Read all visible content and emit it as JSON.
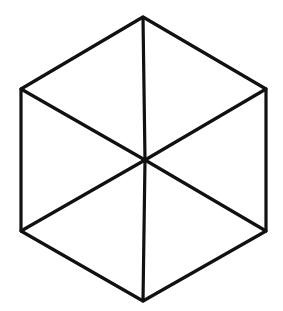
{
  "diagram": {
    "title": "",
    "shape": "hexagon-with-center-spokes",
    "stroke_color": "#111111",
    "background": "#ffffff",
    "stroke_width": 3.2,
    "vertices": [
      {
        "name": "top",
        "x": 143,
        "y": 17
      },
      {
        "name": "upper-right",
        "x": 266,
        "y": 89
      },
      {
        "name": "lower-right",
        "x": 266,
        "y": 231
      },
      {
        "name": "bottom",
        "x": 143,
        "y": 301
      },
      {
        "name": "lower-left",
        "x": 21,
        "y": 231
      },
      {
        "name": "upper-left",
        "x": 21,
        "y": 89
      }
    ],
    "center": {
      "x": 145,
      "y": 160
    },
    "spokes": [
      {
        "from": "top",
        "to": "bottom"
      },
      {
        "from": "upper-left",
        "to": "lower-right"
      },
      {
        "from": "upper-right",
        "to": "lower-left"
      }
    ]
  }
}
